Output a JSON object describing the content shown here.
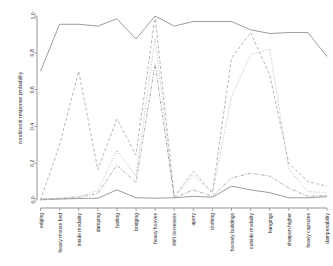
{
  "chart_data": {
    "type": "line",
    "title": "",
    "xlabel": "",
    "ylabel": "conditional response probability",
    "ylim": [
      0.0,
      1.0
    ],
    "yticks": [
      "0.0",
      "0.2",
      "0.4",
      "0.6",
      "0.8",
      "1.0"
    ],
    "ytick_values": [
      0.0,
      0.2,
      0.4,
      0.6,
      0.8,
      1.0
    ],
    "grid": false,
    "legend": "none",
    "categories": [
      "edging",
      "heavy mouse bed",
      "inside modality",
      "damping",
      "halting",
      "bridging",
      "heavy hooves",
      "shift looseness",
      "apery",
      "clothing",
      "hoosely buildings",
      "outside modality",
      "hangings",
      "sharpen higher",
      "heavy capsules",
      "dampenability"
    ],
    "series": [
      {
        "name": "series-1-solid",
        "style": "solid",
        "color": "#8a8a8a",
        "values": [
          0.7,
          0.955,
          0.955,
          0.945,
          0.985,
          0.875,
          1.0,
          0.945,
          0.97,
          0.97,
          0.97,
          0.925,
          0.905,
          0.91,
          0.91,
          0.78
        ]
      },
      {
        "name": "series-2-dashed",
        "style": "dashed",
        "color": "#a8a8a8",
        "values": [
          0.0,
          0.3,
          0.7,
          0.165,
          0.44,
          0.245,
          1.0,
          0.02,
          0.155,
          0.04,
          0.77,
          0.91,
          0.68,
          0.2,
          0.1,
          0.075
        ]
      },
      {
        "name": "series-3-dotted",
        "style": "dotted",
        "color": "#b0b0b0",
        "values": [
          0.0,
          0.01,
          0.02,
          0.05,
          0.27,
          0.13,
          0.88,
          0.01,
          0.135,
          0.035,
          0.56,
          0.79,
          0.82,
          0.17,
          0.045,
          0.04
        ]
      },
      {
        "name": "series-4-dotdash",
        "style": "dotdash",
        "color": "#9c9c9c",
        "values": [
          0.0,
          0.008,
          0.015,
          0.035,
          0.19,
          0.095,
          0.74,
          0.012,
          0.055,
          0.02,
          0.12,
          0.145,
          0.13,
          0.065,
          0.02,
          0.025
        ]
      },
      {
        "name": "series-5-solid-low",
        "style": "solid",
        "color": "#8a8a8a",
        "values": [
          0.005,
          0.005,
          0.008,
          0.01,
          0.055,
          0.012,
          0.01,
          0.012,
          0.02,
          0.015,
          0.075,
          0.055,
          0.04,
          0.012,
          0.012,
          0.018
        ]
      }
    ]
  },
  "axes": {
    "y_axis_label": "conditional response probability"
  }
}
